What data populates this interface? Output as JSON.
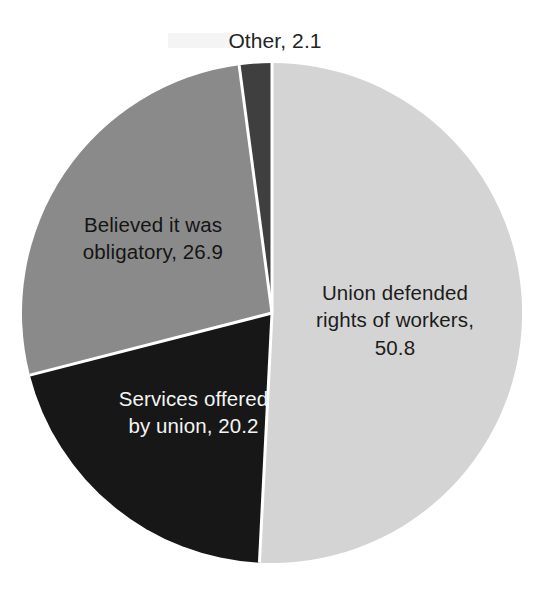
{
  "chart_data": {
    "type": "pie",
    "title": "",
    "subtitle": "",
    "xlabel": "",
    "ylabel": "",
    "legend_position": "none",
    "grid": false,
    "value_unit": "percent",
    "total": 100.0,
    "start_angle_deg": 0,
    "direction": "clockwise",
    "categories": [
      "Union defended rights of workers",
      "Services offered by union",
      "Believed it was obligatory",
      "Other"
    ],
    "values": [
      50.8,
      20.2,
      26.9,
      2.1
    ],
    "slices": [
      {
        "name": "Union defended rights of workers",
        "value": 50.8,
        "label": "Union defended\nrights of workers,\n50.8",
        "color": "#d4d4d4",
        "start_deg": 0.0,
        "end_deg": 182.88,
        "label_color": "#1c1c1c",
        "label_placement": "inside"
      },
      {
        "name": "Services offered by union",
        "value": 20.2,
        "label": "Services offered\nby union, 20.2",
        "color": "#171717",
        "start_deg": 182.88,
        "end_deg": 255.6,
        "label_color": "#f4f4f4",
        "label_placement": "inside"
      },
      {
        "name": "Believed it was obligatory",
        "value": 26.9,
        "label": "Believed it was\nobligatory, 26.9",
        "color": "#8a8a8a",
        "start_deg": 255.6,
        "end_deg": 352.44,
        "label_color": "#141414",
        "label_placement": "inside"
      },
      {
        "name": "Other",
        "value": 2.1,
        "label": "Other, 2.1",
        "color": "#3f3f3f",
        "start_deg": 352.44,
        "end_deg": 360.0,
        "label_color": "#242424",
        "label_placement": "outside-top"
      }
    ],
    "colors": {
      "slice_union_defended": "#d4d4d4",
      "slice_services_offered": "#171717",
      "slice_believed_obligatory": "#8a8a8a",
      "slice_other": "#3f3f3f",
      "separator": "#ffffff",
      "background": "#ffffff"
    },
    "geometry": {
      "center_x": 272,
      "center_y": 313,
      "radius": 250,
      "separator_width": 3
    }
  }
}
